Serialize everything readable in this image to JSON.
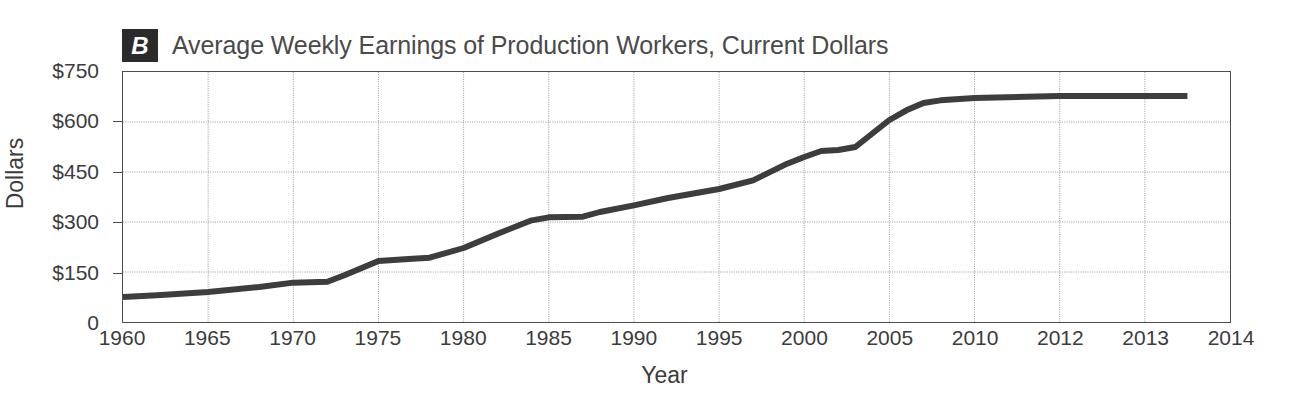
{
  "panel": {
    "badge_letter": "B",
    "title": "Average Weekly Earnings of Production Workers, Current Dollars"
  },
  "axes": {
    "y_label": "Dollars",
    "x_label": "Year",
    "y_ticks": [
      "$750",
      "$600",
      "$450",
      "$300",
      "$150",
      "0"
    ],
    "x_ticks": [
      "1960",
      "1965",
      "1970",
      "1975",
      "1980",
      "1985",
      "1990",
      "1995",
      "2000",
      "2005",
      "2010",
      "2012",
      "2013",
      "2014"
    ]
  },
  "style": {
    "line_color": "#3d3d3d",
    "frame_color": "#4d4d4d",
    "grid_color": "#999999",
    "badge_background": "#2b2b2b",
    "badge_text_color": "#ffffff",
    "title_color": "#4a4a4a",
    "background": "#ffffff"
  },
  "chart_data": {
    "type": "line",
    "title": "Average Weekly Earnings of Production Workers, Current Dollars",
    "xlabel": "Year",
    "ylabel": "Dollars",
    "xlim": [
      1960,
      2014
    ],
    "ylim": [
      0,
      750
    ],
    "ytick_values": [
      0,
      150,
      300,
      450,
      600,
      750
    ],
    "xtick_values": [
      1960,
      1965,
      1970,
      1975,
      1980,
      1985,
      1990,
      1995,
      2000,
      2005,
      2010,
      2012,
      2013,
      2014
    ],
    "xtick_note": "Axis spacing is non-uniform: 1960-2010 in 5-year steps of equal width, then 2012, 2013, 2014 each occupy the same width as a 5-year step.",
    "grid": true,
    "legend": false,
    "series": [
      {
        "name": "Average weekly earnings (current dollars)",
        "x": [
          1960,
          1962,
          1965,
          1968,
          1970,
          1972,
          1973,
          1975,
          1977,
          1978,
          1980,
          1982,
          1984,
          1985,
          1987,
          1988,
          1990,
          1992,
          1995,
          1997,
          1999,
          2000,
          2001,
          2002,
          2003,
          2005,
          2006,
          2007,
          2008,
          2010,
          2012,
          2013.5
        ],
        "y": [
          75,
          80,
          90,
          105,
          118,
          121,
          140,
          183,
          190,
          193,
          222,
          265,
          305,
          314,
          316,
          330,
          350,
          372,
          399,
          425,
          475,
          495,
          513,
          516,
          525,
          606,
          635,
          657,
          665,
          672,
          678,
          678
        ]
      }
    ]
  }
}
